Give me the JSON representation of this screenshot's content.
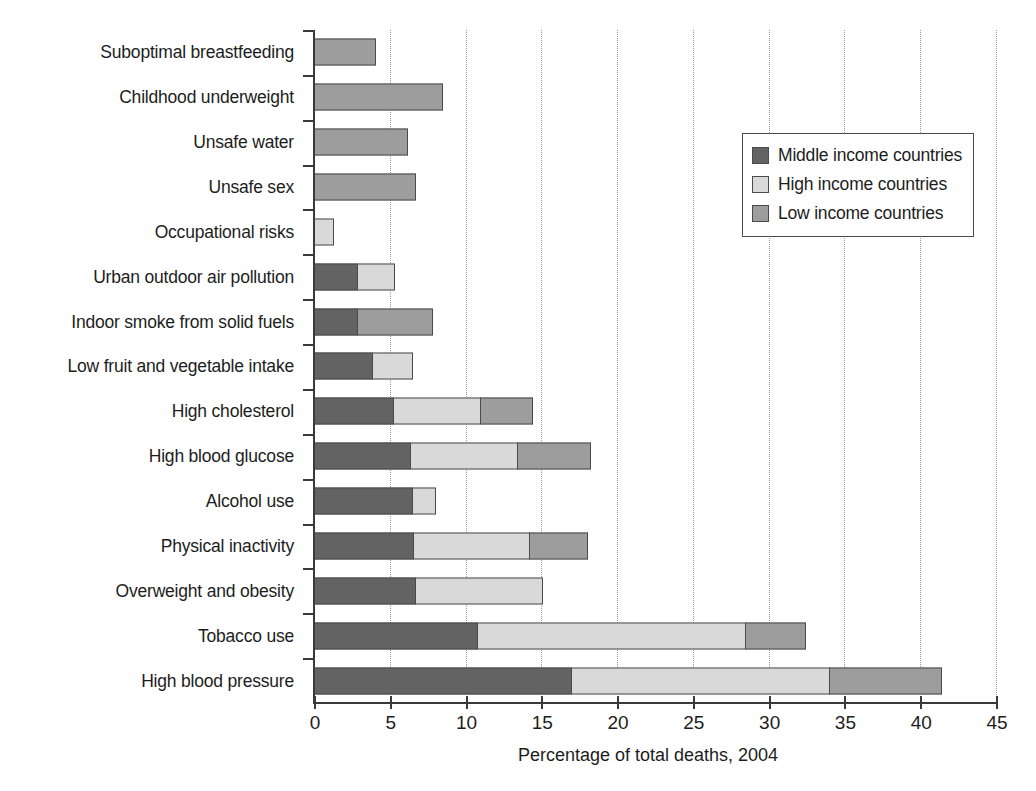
{
  "chart_data": {
    "type": "bar",
    "orientation": "horizontal",
    "stacked": true,
    "title": "",
    "xlabel": "Percentage of total deaths, 2004",
    "ylabel": "",
    "xlim": [
      0,
      45
    ],
    "xticks": [
      0,
      5,
      10,
      15,
      20,
      25,
      30,
      35,
      40,
      45
    ],
    "xticklabels": [
      "0",
      "5",
      "10",
      "15",
      "20",
      "25",
      "30",
      "35",
      "40",
      "45"
    ],
    "grid": "vertical-dotted",
    "legend_position": "upper-right",
    "categories": [
      "Suboptimal breastfeeding",
      "Childhood underweight",
      "Unsafe water",
      "Unsafe sex",
      "Occupational risks",
      "Urban outdoor air pollution",
      "Indoor smoke from solid fuels",
      "Low fruit and vegetable intake",
      "High cholesterol",
      "High blood glucose",
      "Alcohol use",
      "Physical inactivity",
      "Overweight and obesity",
      "Tobacco use",
      "High blood pressure"
    ],
    "series": [
      {
        "name": "Middle income countries",
        "color": "#636363",
        "values": [
          0.0,
          0.0,
          0.0,
          0.0,
          0.0,
          2.9,
          2.9,
          3.9,
          5.3,
          6.4,
          6.5,
          6.6,
          6.7,
          10.8,
          17.0
        ]
      },
      {
        "name": "High income countries",
        "color": "#d9d9d9",
        "values": [
          0.0,
          0.0,
          0.0,
          0.0,
          1.3,
          2.5,
          0.0,
          2.7,
          5.8,
          7.1,
          1.6,
          7.7,
          8.5,
          17.8,
          17.1
        ]
      },
      {
        "name": "Low income countries",
        "color": "#9d9d9d",
        "values": [
          4.1,
          8.5,
          6.2,
          6.7,
          0.0,
          0.0,
          5.0,
          0.0,
          3.5,
          4.9,
          0.0,
          3.9,
          0.0,
          4.0,
          7.5
        ]
      }
    ],
    "totals": [
      4.1,
      8.5,
      6.2,
      6.7,
      1.3,
      5.4,
      7.9,
      6.6,
      14.6,
      18.4,
      8.1,
      18.2,
      15.2,
      32.6,
      41.6
    ]
  },
  "legend": {
    "items": [
      {
        "label": "Middle income countries",
        "swatch": "#636363"
      },
      {
        "label": "High income countries",
        "swatch": "#d9d9d9"
      },
      {
        "label": "Low income countries",
        "swatch": "#9d9d9d"
      }
    ]
  }
}
